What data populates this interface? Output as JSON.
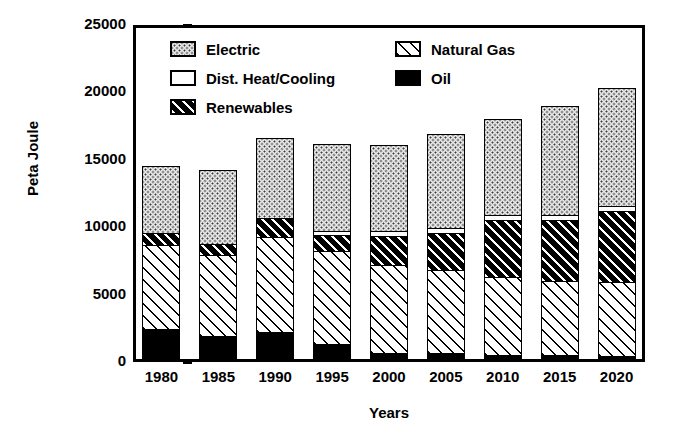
{
  "chart_data": {
    "type": "bar",
    "subtype": "stacked-bar",
    "title": "",
    "xlabel": "Years",
    "ylabel": "Peta Joule",
    "ylim": [
      0,
      25000
    ],
    "yticks": [
      0,
      5000,
      10000,
      15000,
      20000,
      25000
    ],
    "ytick_labels": [
      "0",
      "5000",
      "10000",
      "15000",
      "20000",
      "25000"
    ],
    "grid": false,
    "legend_position": "inside-top-center",
    "categories": [
      "1980",
      "1985",
      "1990",
      "1995",
      "2000",
      "2005",
      "2010",
      "2015",
      "2020"
    ],
    "series": [
      {
        "name": "Oil",
        "pattern": "solid-black",
        "values": [
          2450,
          1950,
          2200,
          1300,
          700,
          650,
          500,
          500,
          450
        ]
      },
      {
        "name": "Natural Gas",
        "pattern": "diagonal-hatch-light",
        "values": [
          6250,
          6000,
          7100,
          6900,
          6500,
          6150,
          5800,
          5500,
          5450
        ]
      },
      {
        "name": "Renewables",
        "pattern": "diagonal-hatch-dark",
        "values": [
          850,
          800,
          1400,
          1200,
          2150,
          2750,
          4200,
          4500,
          5300
        ]
      },
      {
        "name": "Dist. Heat/Cooling",
        "pattern": "white",
        "values": [
          0,
          0,
          0,
          300,
          350,
          400,
          400,
          400,
          400
        ]
      },
      {
        "name": "Electric",
        "pattern": "stipple-dots",
        "values": [
          5000,
          5500,
          5950,
          6500,
          6400,
          7000,
          7100,
          8100,
          8700
        ]
      }
    ],
    "totals": [
      14550,
      14250,
      16650,
      16200,
      16100,
      16950,
      18000,
      19000,
      20300
    ],
    "colors": {
      "axis": "#000000",
      "background": "#ffffff",
      "oil": "#000000",
      "natural_gas": "#ffffff",
      "renewables": "#000000",
      "dist_heat_cooling": "#ffffff",
      "electric": "#e8e8e8"
    }
  },
  "legend": {
    "left_column": [
      {
        "label": "Electric",
        "key": "electric"
      },
      {
        "label": "Dist. Heat/Cooling",
        "key": "heat"
      },
      {
        "label": "Renewables",
        "key": "renew"
      }
    ],
    "right_column": [
      {
        "label": "Natural Gas",
        "key": "gas"
      },
      {
        "label": "Oil",
        "key": "oil"
      }
    ]
  },
  "axes": {
    "y_title": "Peta Joule",
    "x_title": "Years"
  }
}
